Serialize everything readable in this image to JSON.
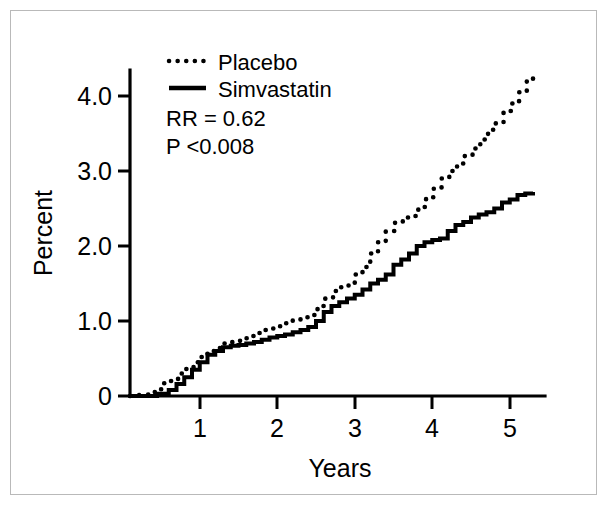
{
  "chart_data": {
    "type": "line",
    "title": "",
    "xlabel": "Years",
    "ylabel": "Percent",
    "xlim": [
      0,
      5.35
    ],
    "ylim": [
      0,
      4.55
    ],
    "xticks": [
      "1",
      "2",
      "3",
      "4",
      "5"
    ],
    "xtick_values": [
      1,
      2,
      3,
      4,
      5
    ],
    "yticks": [
      "0",
      "1.0",
      "2.0",
      "3.0",
      "4.0"
    ],
    "ytick_values": [
      0,
      1.0,
      2.0,
      3.0,
      4.0
    ],
    "grid": false,
    "legend_position": "upper-left-inside",
    "annotations": [
      "RR = 0.62",
      "P <0.008"
    ],
    "series": [
      {
        "name": "Placebo",
        "style": "dotted",
        "x": [
          0.18,
          0.32,
          0.42,
          0.5,
          0.62,
          0.72,
          0.82,
          0.92,
          1.0,
          1.1,
          1.22,
          1.32,
          1.42,
          1.52,
          1.62,
          1.72,
          1.82,
          1.92,
          2.0,
          2.1,
          2.2,
          2.3,
          2.42,
          2.52,
          2.62,
          2.72,
          2.82,
          2.9,
          3.0,
          3.1,
          3.2,
          3.3,
          3.42,
          3.52,
          3.62,
          3.72,
          3.82,
          3.92,
          4.02,
          4.12,
          4.22,
          4.32,
          4.42,
          4.52,
          4.62,
          4.72,
          4.82,
          4.92,
          5.02,
          5.12,
          5.2
        ],
        "y": [
          0.02,
          0.09,
          0.17,
          0.2,
          0.3,
          0.36,
          0.45,
          0.52,
          0.6,
          0.64,
          0.7,
          0.73,
          0.77,
          0.8,
          0.84,
          0.88,
          0.9,
          0.93,
          0.97,
          1.02,
          1.05,
          1.08,
          1.2,
          1.3,
          1.4,
          1.45,
          1.5,
          1.62,
          1.72,
          1.9,
          2.05,
          2.2,
          2.32,
          2.38,
          2.4,
          2.52,
          2.65,
          2.78,
          2.9,
          3.0,
          3.1,
          3.2,
          3.3,
          3.42,
          3.55,
          3.65,
          3.8,
          3.9,
          4.05,
          4.2,
          4.3
        ]
      },
      {
        "name": "Simvastatin",
        "style": "solid",
        "x": [
          0.18,
          0.35,
          0.5,
          0.6,
          0.7,
          0.8,
          0.9,
          1.0,
          1.1,
          1.2,
          1.3,
          1.4,
          1.5,
          1.6,
          1.7,
          1.8,
          1.9,
          2.0,
          2.1,
          2.2,
          2.3,
          2.4,
          2.5,
          2.6,
          2.7,
          2.8,
          2.9,
          3.0,
          3.1,
          3.2,
          3.3,
          3.4,
          3.5,
          3.6,
          3.7,
          3.8,
          3.9,
          4.0,
          4.1,
          4.2,
          4.3,
          4.4,
          4.5,
          4.6,
          4.7,
          4.8,
          4.9,
          5.0,
          5.1,
          5.2
        ],
        "y": [
          0.0,
          0.03,
          0.08,
          0.16,
          0.25,
          0.35,
          0.45,
          0.55,
          0.6,
          0.65,
          0.67,
          0.68,
          0.7,
          0.72,
          0.75,
          0.78,
          0.8,
          0.82,
          0.85,
          0.88,
          0.92,
          1.0,
          1.12,
          1.2,
          1.25,
          1.3,
          1.35,
          1.42,
          1.5,
          1.55,
          1.62,
          1.75,
          1.82,
          1.9,
          2.0,
          2.05,
          2.08,
          2.1,
          2.2,
          2.28,
          2.32,
          2.38,
          2.42,
          2.45,
          2.5,
          2.58,
          2.62,
          2.68,
          2.7,
          2.72
        ]
      }
    ]
  },
  "legend": {
    "items": [
      {
        "label": "Placebo",
        "style": "dotted"
      },
      {
        "label": "Simvastatin",
        "style": "solid"
      }
    ]
  },
  "statistics": {
    "relative_risk": "RR = 0.62",
    "p_value": "P <0.008"
  },
  "axes": {
    "y_title": "Percent",
    "x_title": "Years"
  },
  "colors": {
    "line": "#000000",
    "axis": "#000000",
    "border": "#b9b9b9",
    "background": "#ffffff"
  }
}
